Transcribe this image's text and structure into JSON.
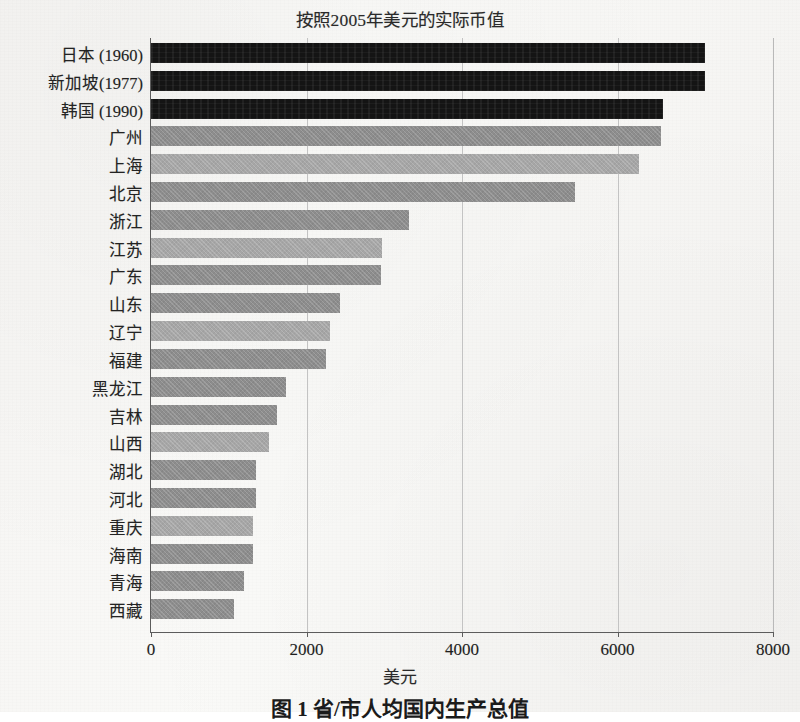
{
  "chart_data": {
    "type": "bar",
    "orientation": "horizontal",
    "title": "按照2005年美元的实际币值",
    "xlabel": "美元",
    "ylabel": "",
    "xlim": [
      0,
      8000
    ],
    "xticks": [
      0,
      2000,
      4000,
      6000,
      8000
    ],
    "xtick_labels": [
      "0",
      "2000",
      "4000",
      "6000",
      "8000"
    ],
    "grid": true,
    "grid_axis": "x",
    "legend": null,
    "categories": [
      "日本 (1960)",
      "新加坡(1977)",
      "韩国 (1990)",
      "广州",
      "上海",
      "北京",
      "浙江",
      "江苏",
      "广东",
      "山东",
      "辽宁",
      "福建",
      "黑龙江",
      "吉林",
      "山西",
      "湖北",
      "河北",
      "重庆",
      "海南",
      "青海",
      "西藏"
    ],
    "values": [
      7120,
      7120,
      6590,
      6560,
      6280,
      5450,
      3320,
      2970,
      2960,
      2430,
      2300,
      2250,
      1740,
      1620,
      1520,
      1350,
      1350,
      1310,
      1310,
      1200,
      1070
    ],
    "bar_styles": [
      "dark",
      "dark",
      "dark",
      "gray-a",
      "gray-b",
      "gray-a",
      "gray-a",
      "gray-b",
      "gray-a",
      "gray-a",
      "gray-b",
      "gray-a",
      "gray-a",
      "gray-a",
      "gray-b",
      "gray-a",
      "gray-a",
      "gray-b",
      "gray-a",
      "gray-a",
      "gray-a"
    ],
    "colors": {
      "dark": "#141414",
      "gray_dark": "#8d8d8d",
      "gray_light": "#a6a6a6",
      "axis": "#5c5c5c",
      "grid": "#c3c3c3",
      "background": "#f7f6f4"
    }
  },
  "caption": "图 1 省/市人均国内生产总值"
}
